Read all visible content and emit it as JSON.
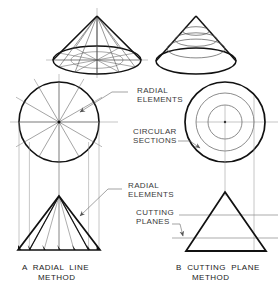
{
  "figure": {
    "background_color": "#ffffff",
    "line_color_bold": "#111111",
    "line_color_thin": "#777777",
    "text_color": "#3a3a3a",
    "width": 278,
    "height": 292
  },
  "annotations": [
    {
      "id": "radial-elements-top",
      "text": "RADIAL\nELEMENTS",
      "x": 137,
      "y": 90
    },
    {
      "id": "circular-sections",
      "text": "CIRCULAR\nSECTIONS",
      "x": 133,
      "y": 131
    },
    {
      "id": "radial-elements-bottom",
      "text": "RADIAL\nELEMENTS",
      "x": 128,
      "y": 185
    },
    {
      "id": "cutting-planes",
      "text": "CUTTING\nPLANES",
      "x": 132,
      "y": 212
    }
  ],
  "captions": [
    {
      "id": "caption-a",
      "letter": "A",
      "line1": "A  RADIAL  LINE",
      "line2": "METHOD",
      "x": 22,
      "y": 264
    },
    {
      "id": "caption-b",
      "letter": "B",
      "line1": "B  CUTTING  PLANE",
      "line2": "METHOD",
      "x": 178,
      "y": 264
    }
  ],
  "drawing": {
    "left_pictorial_cone": {
      "name": "cone-pictorial-radial",
      "apex": [
        97,
        16
      ],
      "base_center": [
        97,
        60
      ],
      "base_rx": 44,
      "base_ry": 14,
      "radial_element_count": 12,
      "has_base_grid": true
    },
    "right_pictorial_cone": {
      "name": "cone-pictorial-sections",
      "apex": [
        196,
        16
      ],
      "base_center": [
        196,
        61
      ],
      "base_rx": 40,
      "base_ry": 13,
      "section_count": 3,
      "section_heights": [
        0.3,
        0.52,
        0.74
      ]
    },
    "left_top_view": {
      "name": "top-view-radial-circle",
      "center": [
        59,
        122
      ],
      "radius": 40,
      "diameter_count": 6,
      "radial_element_count": 12
    },
    "right_top_view": {
      "name": "top-view-circular-sections",
      "center": [
        225,
        122
      ],
      "outer_radius": 40,
      "inner_radii": [
        29,
        17
      ]
    },
    "left_front_view": {
      "name": "front-view-radial-triangle",
      "apex": [
        59,
        196
      ],
      "base_left": [
        18,
        250
      ],
      "base_right": [
        100,
        250
      ],
      "base_division_count": 5
    },
    "right_front_view": {
      "name": "front-view-cutting-plane-triangle",
      "apex": [
        225,
        192
      ],
      "base_left": [
        186,
        251
      ],
      "base_right": [
        266,
        251
      ],
      "cutting_plane_y": [
        215,
        238
      ]
    },
    "projection_lines": {
      "left_count": 5,
      "right_count": 2
    }
  }
}
